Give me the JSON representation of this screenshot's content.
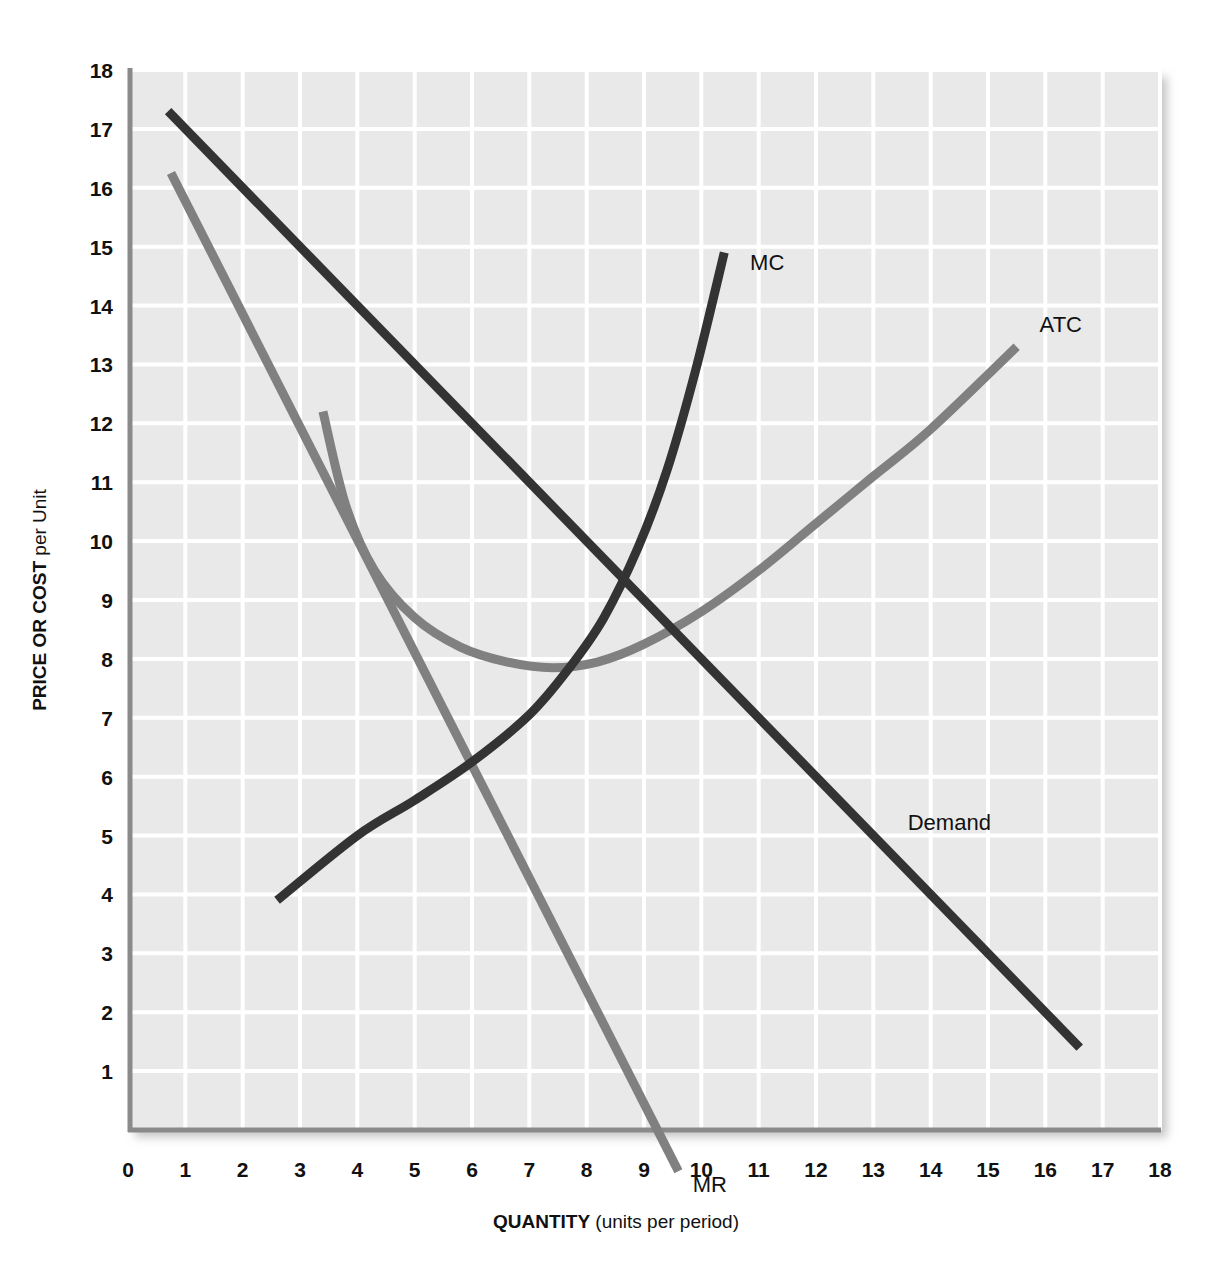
{
  "chart_data": {
    "type": "line",
    "title": "",
    "xlabel_bold": "QUANTITY",
    "xlabel_rest": " (units per period)",
    "ylabel_bold": "PRICE OR COST",
    "ylabel_rest": " per Unit",
    "xlim": [
      0,
      18
    ],
    "ylim": [
      0,
      18
    ],
    "grid": true,
    "legend": "inline-labels",
    "x_ticks": [
      "0",
      "1",
      "2",
      "3",
      "4",
      "5",
      "6",
      "7",
      "8",
      "9",
      "10",
      "11",
      "12",
      "13",
      "14",
      "15",
      "16",
      "17",
      "18"
    ],
    "y_ticks": [
      "1",
      "2",
      "3",
      "4",
      "5",
      "6",
      "7",
      "8",
      "9",
      "10",
      "11",
      "12",
      "13",
      "14",
      "15",
      "16",
      "17",
      "18"
    ],
    "colors": {
      "plot_background": "#e9e9e9",
      "gridline": "#ffffff",
      "axis": "#8a8a8a",
      "dark_curve": "#333333",
      "gray_curve": "#808080",
      "text": "#111111"
    },
    "series": [
      {
        "name": "Demand",
        "label": "Demand",
        "color": "#333333",
        "style": "straight-line",
        "points": [
          [
            0.7,
            17.3
          ],
          [
            16.6,
            1.4
          ]
        ],
        "label_at": [
          13.6,
          5.1
        ]
      },
      {
        "name": "MR",
        "label": "MR",
        "color": "#808080",
        "style": "straight-line",
        "points": [
          [
            0.75,
            16.25
          ],
          [
            9.6,
            -0.7
          ]
        ],
        "x_intercept": 9.1,
        "label_at": [
          9.85,
          -1.05
        ]
      },
      {
        "name": "MC",
        "label": "MC",
        "color": "#333333",
        "style": "upward-curve",
        "points": [
          [
            2.6,
            3.9
          ],
          [
            4.0,
            5.0
          ],
          [
            5.0,
            5.6
          ],
          [
            6.0,
            6.25
          ],
          [
            7.0,
            7.05
          ],
          [
            7.7,
            7.85
          ],
          [
            8.3,
            8.7
          ],
          [
            8.9,
            9.9
          ],
          [
            9.4,
            11.2
          ],
          [
            9.9,
            12.9
          ],
          [
            10.4,
            14.9
          ]
        ],
        "label_at": [
          10.85,
          14.6
        ]
      },
      {
        "name": "ATC",
        "label": "ATC",
        "color": "#808080",
        "style": "u-shaped-curve",
        "points": [
          [
            3.4,
            12.2
          ],
          [
            3.8,
            10.6
          ],
          [
            4.3,
            9.5
          ],
          [
            5.0,
            8.7
          ],
          [
            5.8,
            8.2
          ],
          [
            6.6,
            7.95
          ],
          [
            7.4,
            7.85
          ],
          [
            8.2,
            7.95
          ],
          [
            9.0,
            8.25
          ],
          [
            10.0,
            8.8
          ],
          [
            11.0,
            9.5
          ],
          [
            12.0,
            10.3
          ],
          [
            13.0,
            11.1
          ],
          [
            14.0,
            11.9
          ],
          [
            15.5,
            13.3
          ]
        ],
        "minimum": [
          7.4,
          7.85
        ],
        "label_at": [
          15.9,
          13.55
        ]
      }
    ],
    "key_intersections": [
      {
        "name": "MR = MC",
        "point": [
          6.0,
          6.0
        ]
      },
      {
        "name": "MC = ATC",
        "point": [
          7.85,
          7.9
        ]
      },
      {
        "name": "MC = Demand",
        "point": [
          8.95,
          9.35
        ]
      }
    ]
  }
}
